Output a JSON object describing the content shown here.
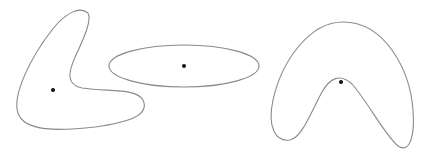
{
  "diagram": {
    "background": "#ffffff",
    "stroke_color": "#8a8a8a",
    "dot_color": "#111111",
    "shapes": [
      {
        "id": "boomerang-shape",
        "kind": "non-convex L-shaped blob",
        "path": "M 88 13 C 80 6, 66 12, 52 30 C 30 58, 12 96, 18 113 C 24 132, 60 131, 95 127 C 130 122, 150 115, 143 100 C 136 88, 110 92, 82 88 C 66 85, 68 72, 76 55 C 84 38, 92 20, 88 13 Z",
        "dot": {
          "cx": 53,
          "cy": 90,
          "r": 2
        }
      },
      {
        "id": "ellipse-shape",
        "kind": "ellipse",
        "ellipse": {
          "cx": 184,
          "cy": 66,
          "rx": 75,
          "ry": 21
        },
        "dot": {
          "cx": 184,
          "cy": 66,
          "r": 2
        }
      },
      {
        "id": "arch-shape",
        "kind": "non-convex arch (banana) shape",
        "path": "M 343 22 C 310 22, 282 60, 273 100 C 267 128, 276 142, 290 140 C 302 138, 312 110, 322 92 C 330 78, 340 73, 352 84 C 368 102, 384 134, 398 146 C 410 154, 415 135, 413 110 C 410 70, 385 22, 343 22 Z",
        "dot": {
          "cx": 341,
          "cy": 82,
          "r": 2
        }
      }
    ]
  }
}
